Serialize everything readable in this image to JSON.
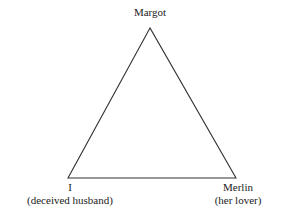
{
  "diagram": {
    "type": "triangle",
    "nodes": [
      {
        "id": "top",
        "name": "Margot",
        "role": ""
      },
      {
        "id": "left",
        "name": "I",
        "role": "(deceived husband)"
      },
      {
        "id": "right",
        "name": "Merlin",
        "role": "(her lover)"
      }
    ],
    "edges": [
      [
        "top",
        "left"
      ],
      [
        "top",
        "right"
      ],
      [
        "left",
        "right"
      ]
    ],
    "line_color": "#333333"
  }
}
